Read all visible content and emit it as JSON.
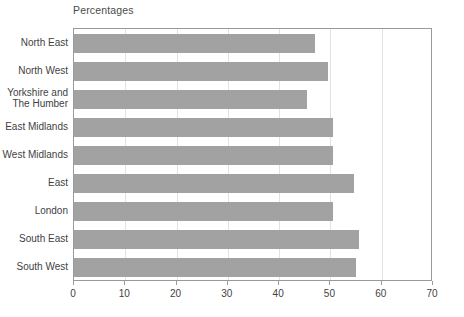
{
  "chart_data": {
    "type": "bar",
    "orientation": "horizontal",
    "title": "Percentages",
    "xlabel": "",
    "ylabel": "",
    "xlim": [
      0,
      70
    ],
    "xticks": [
      0,
      10,
      20,
      30,
      40,
      50,
      60,
      70
    ],
    "grid": true,
    "grid_axis": "x",
    "legend": false,
    "bar_color": "#a2a2a2",
    "axis_color": "#9a9a9a",
    "gridline_color": "#e2e2e2",
    "categories": [
      "North East",
      "North West",
      "Yorkshire and\nThe Humber",
      "East Midlands",
      "West Midlands",
      "East",
      "London",
      "South East",
      "South West"
    ],
    "values": [
      47,
      49.5,
      45.5,
      50.5,
      50.5,
      54.5,
      50.5,
      55.5,
      55
    ]
  },
  "axis": {
    "tick_labels": [
      "0",
      "10",
      "20",
      "30",
      "40",
      "50",
      "60",
      "70"
    ]
  },
  "categories_display": [
    {
      "lines": [
        "North East"
      ]
    },
    {
      "lines": [
        "North West"
      ]
    },
    {
      "lines": [
        "Yorkshire and",
        "The Humber"
      ]
    },
    {
      "lines": [
        "East Midlands"
      ]
    },
    {
      "lines": [
        "West Midlands"
      ]
    },
    {
      "lines": [
        "East"
      ]
    },
    {
      "lines": [
        "London"
      ]
    },
    {
      "lines": [
        "South East"
      ]
    },
    {
      "lines": [
        "South West"
      ]
    }
  ]
}
